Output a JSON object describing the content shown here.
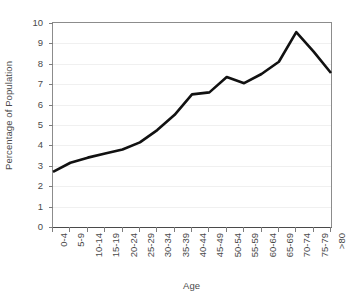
{
  "chart_data": {
    "type": "line",
    "title": "",
    "xlabel": "Age",
    "ylabel": "Percentage of Population",
    "categories": [
      "0-4",
      "5-9",
      "10-14",
      "15-19",
      "20-24",
      "25-29",
      "30-34",
      "35-39",
      "40-44",
      "45-49",
      "50-54",
      "55-59",
      "60-64",
      "65-69",
      "70-74",
      "75-79",
      ">80"
    ],
    "values": [
      2.7,
      3.15,
      3.4,
      3.6,
      3.8,
      4.15,
      4.75,
      5.5,
      6.5,
      6.6,
      7.35,
      7.05,
      7.5,
      8.1,
      9.55,
      8.6,
      7.55
    ],
    "ylim": [
      0,
      10
    ],
    "ytick_labels": [
      "0",
      "1",
      "2",
      "3",
      "4",
      "5",
      "6",
      "7",
      "8",
      "9",
      "10"
    ],
    "ytick_values": [
      0,
      1,
      2,
      3,
      4,
      5,
      6,
      7,
      8,
      9,
      10
    ],
    "grid": true,
    "legend": "none",
    "series_color": "#111111",
    "series_width": 2.6,
    "axis_color": "#4a4a4a",
    "grid_color": "#f0f0f0",
    "background": "#ffffff"
  }
}
